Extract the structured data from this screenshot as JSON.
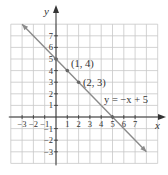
{
  "chart_data": {
    "type": "line",
    "title": "",
    "xlabel": "x",
    "ylabel": "y",
    "xlim": [
      -4,
      9
    ],
    "ylim": [
      -4,
      8
    ],
    "grid": true,
    "x_ticks": [
      -3,
      -2,
      -1,
      1,
      2,
      3,
      4,
      5,
      6,
      7
    ],
    "y_ticks": [
      -3,
      -2,
      -1,
      1,
      2,
      3,
      4,
      5,
      6,
      7
    ],
    "series": [
      {
        "name": "y = −x + 5",
        "equation": "y = -x + 5",
        "slope": -1,
        "intercept": 5,
        "x": [
          -3,
          8
        ],
        "y": [
          8,
          -3
        ],
        "arrows": "both"
      }
    ],
    "points": [
      {
        "x": 0,
        "y": 5,
        "label": ""
      },
      {
        "x": 1,
        "y": 4,
        "label": "(1, 4)"
      },
      {
        "x": 2,
        "y": 3,
        "label": "(2, 3)"
      },
      {
        "x": 5,
        "y": 0,
        "label": ""
      }
    ],
    "annotations": [
      {
        "text": "(1, 4)",
        "at": [
          1,
          4
        ]
      },
      {
        "text": "(2, 3)",
        "at": [
          2,
          3
        ]
      },
      {
        "text": "y = −x + 5",
        "at": [
          4,
          1.7
        ]
      }
    ],
    "colors": {
      "grid": "#c8c8c8",
      "axis": "#333333",
      "line": "#8a8a8a",
      "point": "#666666",
      "text": "#333333"
    }
  },
  "labels": {
    "x_axis": "x",
    "y_axis": "y",
    "point_1": "(1, 4)",
    "point_2": "(2, 3)",
    "equation": "y = −x + 5",
    "x_ticks": [
      "−3",
      "−2",
      "−1",
      "1",
      "2",
      "3",
      "4",
      "5",
      "6",
      "7"
    ],
    "y_ticks": [
      "7",
      "6",
      "5",
      "4",
      "3",
      "2",
      "1",
      "−1",
      "−2",
      "−3"
    ]
  }
}
